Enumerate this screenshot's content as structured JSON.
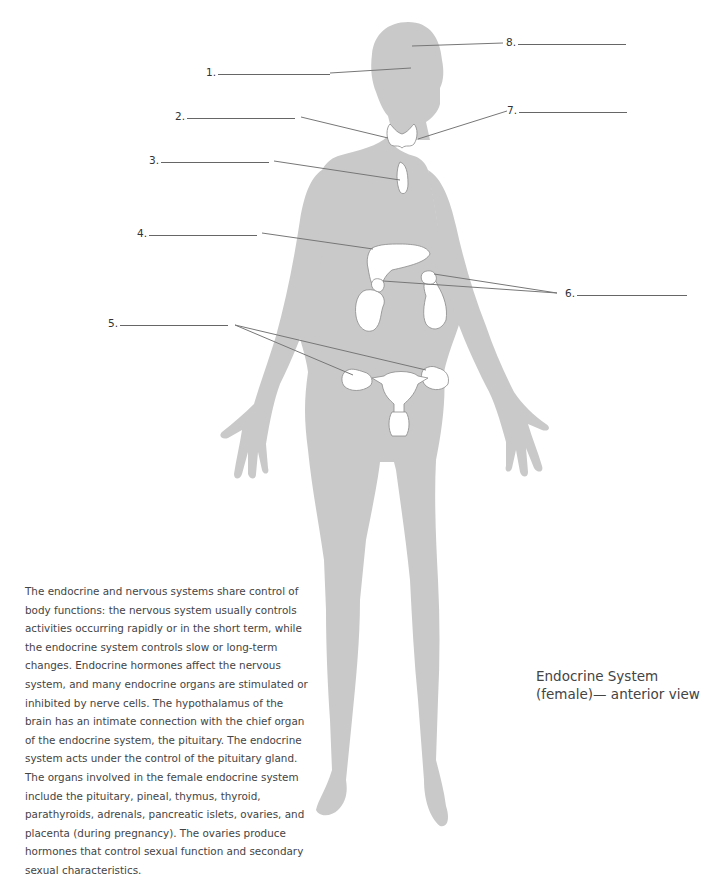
{
  "diagram": {
    "labels": [
      {
        "number": "1.",
        "blank": "",
        "target": "pituitary region (head)"
      },
      {
        "number": "2.",
        "blank": "",
        "target": "thyroid (left)"
      },
      {
        "number": "3.",
        "blank": "",
        "target": "thymus"
      },
      {
        "number": "4.",
        "blank": "",
        "target": "pancreas"
      },
      {
        "number": "5.",
        "blank": "",
        "target": "ovaries"
      },
      {
        "number": "6.",
        "blank": "",
        "target": "adrenals"
      },
      {
        "number": "7.",
        "blank": "",
        "target": "parathyroids / thyroid (right)"
      },
      {
        "number": "8.",
        "blank": "",
        "target": "pineal region (head)"
      }
    ],
    "colors": {
      "silhouette": "#c9c9c9",
      "organ_fill": "#ffffff",
      "organ_stroke": "#8a8a8a",
      "leader_line": "#777777",
      "text": "#444444"
    }
  },
  "description": "The endocrine and nervous systems share control of body functions: the nervous system usually controls activities occurring rapidly or in the short term, while the endocrine system controls slow or long-term changes. Endocrine hormones affect the nervous system, and many endocrine organs are stimulated or inhibited by nerve cells. The hypothalamus of the brain has an intimate connection with the chief organ of the endocrine system, the pituitary. The endocrine system acts under the control of the pituitary gland. The organs involved in the female endocrine system include the pituitary, pineal, thymus, thyroid, parathyroids, adrenals, pancreatic islets, ovaries, and placenta (during pregnancy). The ovaries produce hormones that control sexual function and secondary sexual characteristics.",
  "caption": "Endocrine System (female)— anterior view"
}
